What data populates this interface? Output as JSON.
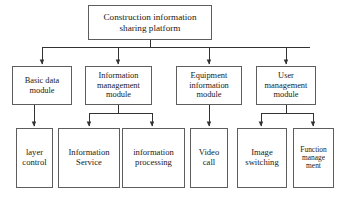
{
  "diagram": {
    "type": "hierarchy-tree",
    "colors": {
      "background": "#ffffff",
      "box_border": "#5d5d5d",
      "connector": "#333333",
      "text": "#1a1a1a"
    },
    "root": {
      "id": "root",
      "label": "Construction information sharing platform"
    },
    "modules": [
      {
        "id": "basic-data-module",
        "label": "Basic data module"
      },
      {
        "id": "information-management-module",
        "label": "Information management module"
      },
      {
        "id": "equipment-information-module",
        "label": "Equipment information module"
      },
      {
        "id": "user-management-module",
        "label": "User management module"
      }
    ],
    "leaves": [
      {
        "id": "layer-control",
        "label": "layer control",
        "parent": "basic-data-module"
      },
      {
        "id": "information-service",
        "label": "Information Service",
        "parent": "information-management-module"
      },
      {
        "id": "information-processing",
        "label": "information processing",
        "parent": "information-management-module"
      },
      {
        "id": "video-call",
        "label": "Video call",
        "parent": "equipment-information-module"
      },
      {
        "id": "image-switching",
        "label": "Image switching",
        "parent": "user-management-module"
      },
      {
        "id": "function-management",
        "label": "Function manage ment",
        "parent": "user-management-module"
      }
    ]
  }
}
